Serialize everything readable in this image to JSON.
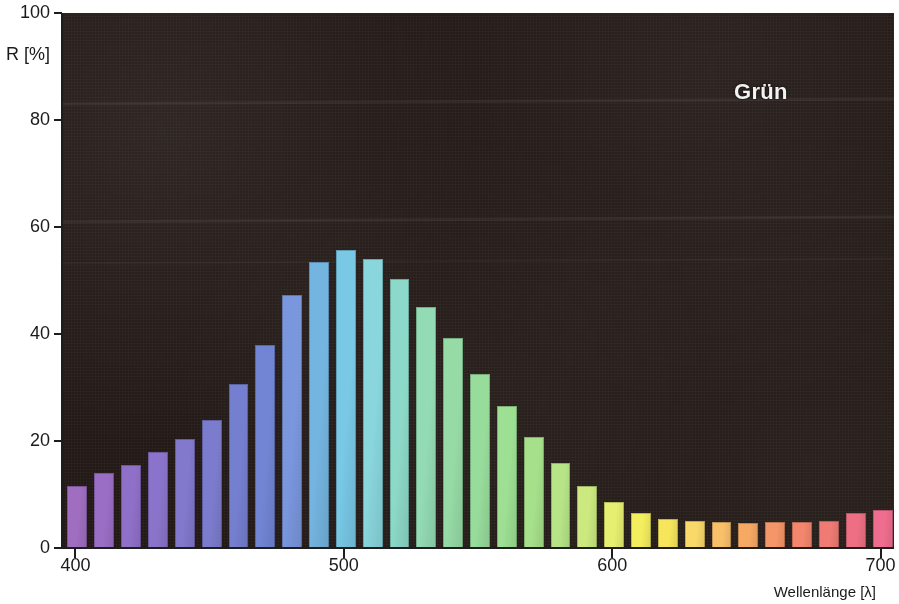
{
  "chart_data": {
    "type": "bar",
    "title": "Grün",
    "xlabel": "Wellenlänge [λ]",
    "ylabel": "R [%]",
    "xlim": [
      395,
      705
    ],
    "ylim": [
      0,
      100
    ],
    "grid": false,
    "legend": "none",
    "x_tick_labels": [
      "400",
      "500",
      "600",
      "700"
    ],
    "x_ticks": [
      400,
      500,
      600,
      700
    ],
    "y_tick_labels": [
      "0",
      "20",
      "40",
      "60",
      "80",
      "100"
    ],
    "y_ticks": [
      0,
      20,
      40,
      60,
      80,
      100
    ],
    "categories": [
      400,
      410,
      420,
      430,
      440,
      450,
      460,
      470,
      480,
      490,
      500,
      510,
      520,
      530,
      540,
      550,
      560,
      570,
      580,
      590,
      600,
      610,
      620,
      630,
      640,
      650,
      660,
      670,
      680,
      690,
      700
    ],
    "values": [
      11.5,
      14.0,
      15.6,
      17.9,
      20.3,
      24.0,
      30.6,
      38.0,
      47.3,
      53.4,
      55.7,
      54.0,
      50.2,
      45.1,
      39.3,
      32.6,
      26.6,
      20.8,
      15.9,
      11.6,
      8.6,
      6.5,
      5.4,
      5.0,
      4.9,
      4.6,
      4.9,
      4.9,
      5.0,
      6.6,
      7.1
    ],
    "bar_colors": [
      "#9f6ec0",
      "#9b6ec6",
      "#8f70c8",
      "#8a74cb",
      "#8278cc",
      "#7b7ccd",
      "#757fd0",
      "#7285d4",
      "#7a96dd",
      "#74b4e0",
      "#78c8e6",
      "#89d6dd",
      "#8dd9c9",
      "#93dbb4",
      "#96dba6",
      "#98dc9c",
      "#9ddf93",
      "#a6e08a",
      "#b6e487",
      "#cbe97f",
      "#e6ef6f",
      "#f3ee5e",
      "#f7e65c",
      "#f9d96a",
      "#f9c06a",
      "#f7a964",
      "#f59668",
      "#f2876d",
      "#ef7b74",
      "#ee6f83",
      "#ef6d8f"
    ],
    "background_color": "#231a17",
    "axis_color": "#1d1d1d",
    "title_color": "#f2f2f2"
  }
}
